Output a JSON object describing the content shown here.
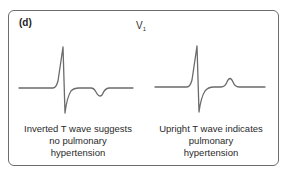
{
  "figure": {
    "panel_label": "(d)",
    "lead": {
      "main": "V",
      "sub": "1"
    },
    "colors": {
      "trace": "#6b6b6b",
      "border": "#6d6d6d",
      "text": "#2a2a2a"
    },
    "left": {
      "waveform": "ecg-inverted-t-wave",
      "caption_lines": [
        "Inverted T wave suggests",
        "no pulmonary",
        "hypertension"
      ]
    },
    "right": {
      "waveform": "ecg-upright-t-wave",
      "caption_lines": [
        "Upright T wave indicates",
        "pulmonary",
        "hypertension"
      ]
    }
  }
}
